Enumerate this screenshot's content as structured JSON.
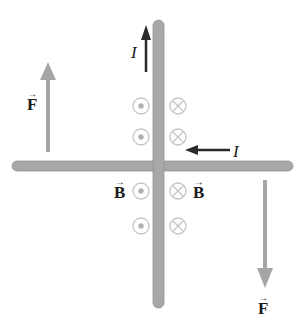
{
  "diagram": {
    "labels": {
      "force_left": "F",
      "force_right": "F",
      "field_left": "B",
      "field_right": "B",
      "current_vertical": "I",
      "current_horizontal": "I",
      "vector_arrow": "→"
    },
    "symbols": {
      "out_of_page": "dot-in-circle",
      "into_page": "cross-in-circle"
    },
    "colors": {
      "rod": "#a8a8a8",
      "rod_edge": "#8c8c8c",
      "force_arrow": "#a6a6a6",
      "current_arrow": "#2a2a2a",
      "field_symbol": "#bdbdbd",
      "text": "#1a1a1a"
    }
  }
}
